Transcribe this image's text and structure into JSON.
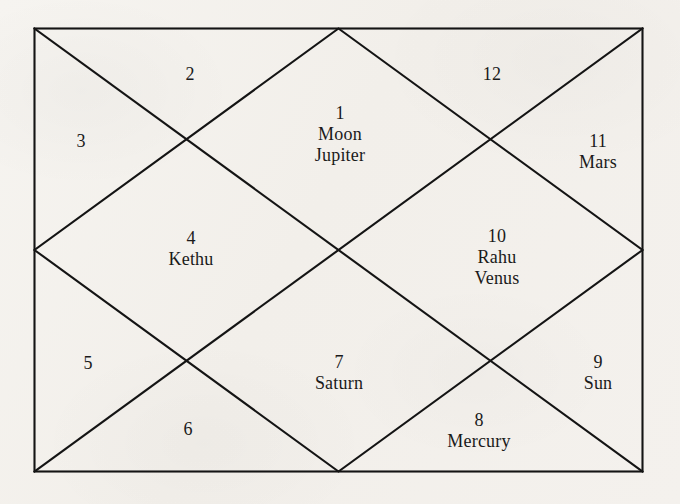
{
  "chart": {
    "style": "north-indian-kundali",
    "line_color": "#141414",
    "background_color": "#f4f2ee",
    "text_color": "#1a1a1a",
    "frame": {
      "left": 34,
      "top": 28,
      "right": 643,
      "bottom": 472
    },
    "center": {
      "x": 340,
      "y": 252
    },
    "houses": [
      {
        "number": "1",
        "shape": "top-center-diamond",
        "planets": [
          "Moon",
          "Jupiter"
        ],
        "label_x": 340,
        "label_y": 103
      },
      {
        "number": "2",
        "shape": "top-left-triangle",
        "planets": [],
        "label_x": 190,
        "label_y": 64
      },
      {
        "number": "3",
        "shape": "left-upper-triangle",
        "planets": [],
        "label_x": 81,
        "label_y": 131
      },
      {
        "number": "4",
        "shape": "left-center-diamond",
        "planets": [
          "Kethu"
        ],
        "label_x": 191,
        "label_y": 228
      },
      {
        "number": "5",
        "shape": "left-lower-triangle",
        "planets": [],
        "label_x": 88,
        "label_y": 353
      },
      {
        "number": "6",
        "shape": "bottom-left-triangle",
        "planets": [],
        "label_x": 188,
        "label_y": 419
      },
      {
        "number": "7",
        "shape": "bottom-center-diamond",
        "planets": [
          "Saturn"
        ],
        "label_x": 339,
        "label_y": 352
      },
      {
        "number": "8",
        "shape": "bottom-right-triangle",
        "planets": [
          "Mercury"
        ],
        "label_x": 479,
        "label_y": 410
      },
      {
        "number": "9",
        "shape": "right-lower-triangle",
        "planets": [
          "Sun"
        ],
        "label_x": 598,
        "label_y": 352
      },
      {
        "number": "10",
        "shape": "right-center-diamond",
        "planets": [
          "Rahu",
          "Venus"
        ],
        "label_x": 497,
        "label_y": 226
      },
      {
        "number": "11",
        "shape": "right-upper-triangle",
        "planets": [
          "Mars"
        ],
        "label_x": 598,
        "label_y": 131
      },
      {
        "number": "12",
        "shape": "top-right-triangle",
        "planets": [],
        "label_x": 492,
        "label_y": 64
      }
    ]
  }
}
